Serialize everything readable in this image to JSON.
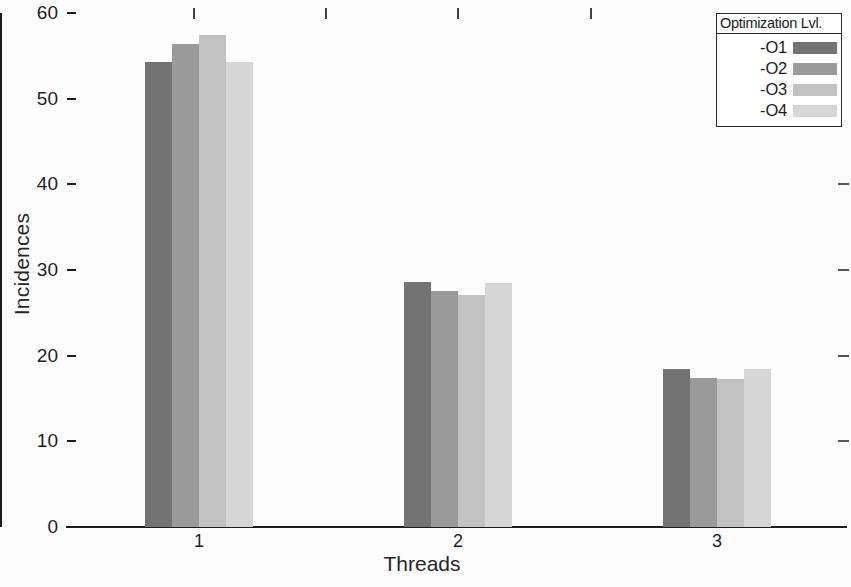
{
  "chart_data": {
    "type": "bar",
    "title": "",
    "xlabel": "Threads",
    "ylabel": "Incidences",
    "categories": [
      "1",
      "2",
      "3"
    ],
    "series": [
      {
        "name": "-O1",
        "values": [
          54.3,
          28.6,
          18.5
        ],
        "color": "#737373"
      },
      {
        "name": "-O2",
        "values": [
          56.4,
          27.6,
          17.4
        ],
        "color": "#9a9a9a"
      },
      {
        "name": "-O3",
        "values": [
          57.4,
          27.1,
          17.3
        ],
        "color": "#c2c2c2"
      },
      {
        "name": "-O4",
        "values": [
          54.3,
          28.5,
          18.4
        ],
        "color": "#d6d6d6"
      }
    ],
    "ylim": [
      0,
      60
    ],
    "yticks": [
      0,
      10,
      20,
      30,
      40,
      50,
      60
    ],
    "ytick_labels": [
      "0",
      "10",
      "20",
      "30",
      "40",
      "50",
      "60"
    ],
    "xtick_labels": [
      "1",
      "2",
      "3"
    ],
    "grid": false,
    "legend_position": "top-right"
  },
  "axes": {
    "y_title": "Incidences",
    "x_title": "Threads",
    "y_tick_labels": [
      "60",
      "50",
      "40",
      "30",
      "20",
      "10",
      "0"
    ],
    "x_tick_labels": [
      "1",
      "2",
      "3"
    ]
  },
  "legend": {
    "title": "Optimization Lvl.",
    "entries": [
      {
        "label": "-O1",
        "color": "#737373"
      },
      {
        "label": "-O2",
        "color": "#9a9a9a"
      },
      {
        "label": "-O3",
        "color": "#c2c2c2"
      },
      {
        "label": "-O4",
        "color": "#d6d6d6"
      }
    ]
  }
}
